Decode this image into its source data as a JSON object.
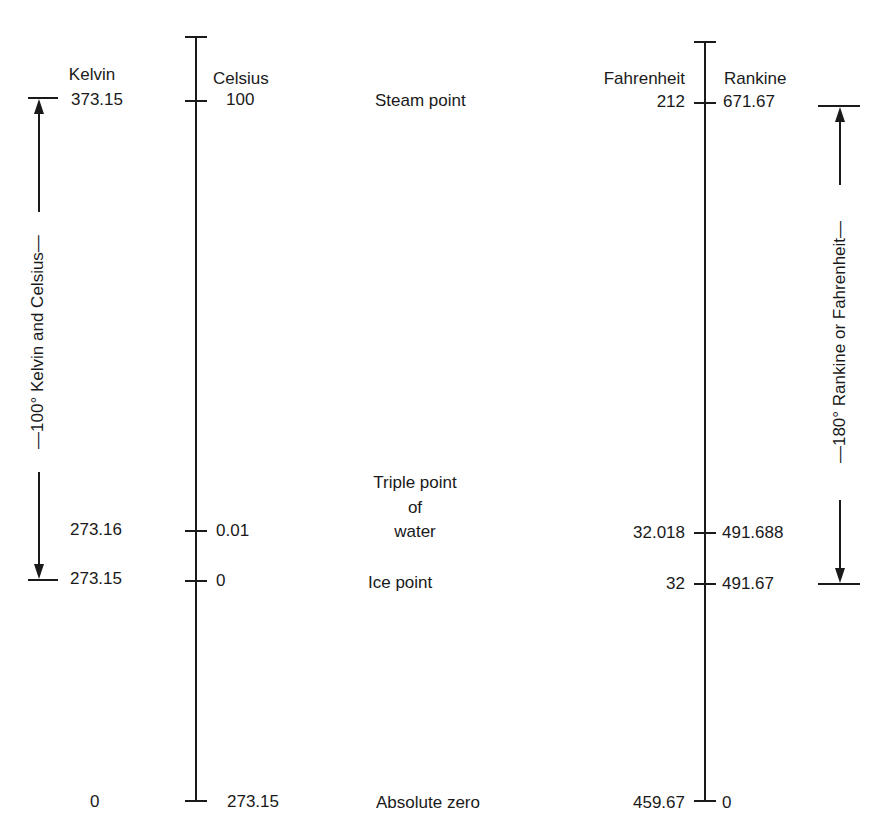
{
  "scales": {
    "kelvin": {
      "name": "Kelvin",
      "steam": "373.15",
      "triple": "273.16",
      "ice": "273.15",
      "zero": "0"
    },
    "celsius": {
      "name": "Celsius",
      "steam": "100",
      "triple": "0.01",
      "ice": "0",
      "zero": "273.15"
    },
    "fahrenheit": {
      "name": "Fahrenheit",
      "steam": "212",
      "triple": "32.018",
      "ice": "32",
      "zero": "459.67"
    },
    "rankine": {
      "name": "Rankine",
      "steam": "671.67",
      "triple": "491.688",
      "ice": "491.67",
      "zero": "0"
    }
  },
  "points": {
    "steam": "Steam point",
    "triple_1": "Triple point",
    "triple_2": "of",
    "triple_3": "water",
    "ice": "Ice point",
    "zero": "Absolute zero"
  },
  "brackets": {
    "left": "—100° Kelvin and Celsius—",
    "right": "—180° Rankine or Fahrenheit—"
  },
  "colors": {
    "ink": "#1a1a1a",
    "background": "#ffffff"
  }
}
